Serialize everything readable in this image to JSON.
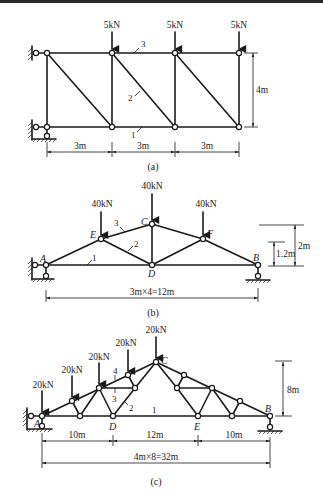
{
  "figure_a": {
    "caption": "(a)",
    "loads": [
      "5kN",
      "5kN",
      "5kN"
    ],
    "member_labels": [
      "1",
      "2",
      "3"
    ],
    "dims": {
      "spans": [
        "3m",
        "3m",
        "3m"
      ],
      "height": "4m"
    }
  },
  "figure_b": {
    "caption": "(b)",
    "loads": [
      "40kN",
      "40kN",
      "40kN"
    ],
    "nodes": {
      "A": "A",
      "B": "B",
      "C": "C",
      "D": "D",
      "E": "E",
      "F": "F"
    },
    "member_labels": [
      "1",
      "2",
      "3"
    ],
    "dims": {
      "span": "3m×4=12m",
      "height_outer": "2m",
      "height_inner": "1.2m"
    }
  },
  "figure_c": {
    "caption": "(c)",
    "loads": [
      "20kN",
      "20kN",
      "20kN",
      "20kN",
      "20kN"
    ],
    "nodes": {
      "A": "A",
      "B": "B",
      "C": "C",
      "D": "D",
      "E": "E"
    },
    "member_labels": [
      "1",
      "2",
      "3",
      "4"
    ],
    "dims": {
      "left": "10m",
      "middle": "12m",
      "right": "10m",
      "span": "4m×8=32m",
      "height": "8m"
    }
  },
  "colors": {
    "ink": "#1a1a1a",
    "background": "#ffffff"
  }
}
